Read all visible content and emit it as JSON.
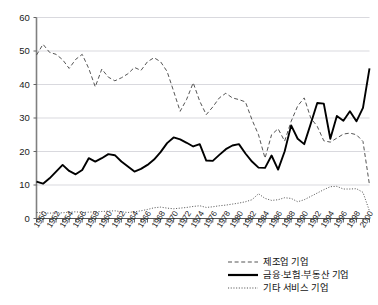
{
  "chart_data": {
    "type": "line",
    "title": "",
    "xlabel": "",
    "ylabel": "",
    "xlim": [
      1950,
      2001
    ],
    "ylim": [
      0,
      60
    ],
    "grid": true,
    "legend_position": "bottom-right",
    "y_ticks": [
      0,
      10,
      20,
      30,
      40,
      50,
      60
    ],
    "x_ticks": [
      1950,
      1952,
      1954,
      1956,
      1958,
      1960,
      1962,
      1964,
      1966,
      1968,
      1970,
      1972,
      1974,
      1976,
      1978,
      1980,
      1982,
      1984,
      1986,
      1988,
      1990,
      1992,
      1994,
      1996,
      1998,
      2000
    ],
    "x": [
      1950,
      1951,
      1952,
      1953,
      1954,
      1955,
      1956,
      1957,
      1958,
      1959,
      1960,
      1961,
      1962,
      1963,
      1964,
      1965,
      1966,
      1967,
      1968,
      1969,
      1970,
      1971,
      1972,
      1973,
      1974,
      1975,
      1976,
      1977,
      1978,
      1979,
      1980,
      1981,
      1982,
      1983,
      1984,
      1985,
      1986,
      1987,
      1988,
      1989,
      1990,
      1991,
      1992,
      1993,
      1994,
      1995,
      1996,
      1997,
      1998,
      1999,
      2000,
      2001
    ],
    "series": [
      {
        "name": "제조업 기업",
        "style": "dashed",
        "color": "#555555",
        "values": [
          48.8,
          52.0,
          49.6,
          49.0,
          47.4,
          44.8,
          47.5,
          49.0,
          44.8,
          39.3,
          44.6,
          42.2,
          41.1,
          42.0,
          43.2,
          45.1,
          44.2,
          46.8,
          48.0,
          46.8,
          43.9,
          38.0,
          32.0,
          35.6,
          40.5,
          35.0,
          31.0,
          33.3,
          36.0,
          37.4,
          36.0,
          35.5,
          34.8,
          29.5,
          25.0,
          18.0,
          25.0,
          26.8,
          23.1,
          29.0,
          33.6,
          36.0,
          30.0,
          27.5,
          23.2,
          22.8,
          24.0,
          25.2,
          25.5,
          25.0,
          23.0,
          10.0
        ]
      },
      {
        "name": "금융·보험·부동산 기업",
        "style": "solid",
        "color": "#000000",
        "values": [
          11.0,
          10.4,
          12.0,
          14.0,
          16.0,
          14.2,
          13.2,
          14.5,
          18.0,
          17.0,
          18.0,
          19.2,
          18.9,
          17.0,
          15.5,
          14.0,
          14.8,
          16.0,
          17.6,
          19.8,
          22.5,
          24.2,
          23.6,
          22.6,
          21.5,
          22.2,
          17.3,
          17.2,
          19.0,
          20.7,
          21.8,
          22.2,
          19.4,
          17.0,
          15.2,
          15.1,
          18.8,
          14.6,
          20.0,
          27.8,
          23.8,
          22.2,
          28.3,
          34.5,
          34.3,
          23.8,
          30.6,
          29.2,
          32.0,
          29.0,
          33.0,
          44.8
        ]
      },
      {
        "name": "기타 서비스 기업",
        "style": "dotted",
        "color": "#555555",
        "values": [
          1.8,
          1.7,
          1.6,
          1.7,
          1.7,
          1.9,
          2.0,
          1.8,
          1.9,
          2.0,
          2.1,
          2.2,
          2.3,
          2.0,
          1.8,
          2.0,
          2.3,
          2.7,
          3.2,
          3.4,
          3.1,
          2.9,
          3.1,
          3.3,
          3.6,
          3.8,
          3.3,
          3.5,
          3.8,
          4.0,
          4.3,
          4.6,
          5.0,
          5.6,
          7.4,
          6.0,
          5.4,
          5.6,
          6.2,
          6.0,
          5.0,
          5.6,
          6.6,
          7.6,
          8.6,
          9.5,
          9.6,
          8.8,
          8.8,
          8.9,
          7.8,
          2.2
        ]
      }
    ]
  },
  "legend": {
    "items": [
      {
        "label": "제조업 기업",
        "style": "dashed"
      },
      {
        "label": "금융·보험·부동산 기업",
        "style": "solid"
      },
      {
        "label": "기타 서비스 기업",
        "style": "dotted"
      }
    ]
  }
}
